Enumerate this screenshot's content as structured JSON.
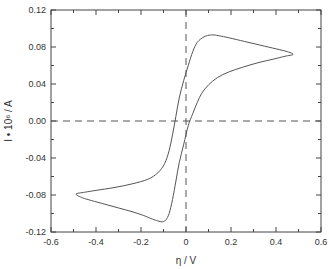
{
  "chart_data": {
    "type": "line",
    "title": "",
    "xlabel": "η / V",
    "ylabel": "I • 10⁶ / A",
    "xlim": [
      -0.6,
      0.6
    ],
    "ylim": [
      -0.12,
      0.12
    ],
    "xticks": [
      -0.6,
      -0.4,
      -0.2,
      0,
      0.2,
      0.4,
      0.6
    ],
    "xtick_labels": [
      "-0.6",
      "-0.4",
      "-0.2",
      "0",
      "0.2",
      "0.4",
      "0.6"
    ],
    "yticks": [
      -0.12,
      -0.08,
      -0.04,
      0.0,
      0.04,
      0.08,
      0.12
    ],
    "ytick_labels": [
      "-0.12",
      "-0.08",
      "-0.04",
      "0.00",
      "0.04",
      "0.08",
      "0.12"
    ],
    "grid": false,
    "reference_lines": [
      {
        "orientation": "horizontal",
        "value": 0,
        "style": "dashed"
      },
      {
        "orientation": "vertical",
        "value": 0,
        "style": "dashed"
      }
    ],
    "series": [
      {
        "name": "cyclic voltammogram",
        "closed": true,
        "x": [
          0.107,
          0.08,
          0.05,
          0.03,
          0.01,
          -0.01,
          -0.03,
          -0.045,
          -0.06,
          -0.075,
          -0.095,
          -0.125,
          -0.17,
          -0.24,
          -0.32,
          -0.4,
          -0.45,
          -0.489,
          -0.46,
          -0.42,
          -0.36,
          -0.3,
          -0.24,
          -0.19,
          -0.15,
          -0.125,
          -0.105,
          -0.09,
          -0.075,
          -0.06,
          -0.045,
          -0.03,
          -0.01,
          0.01,
          0.03,
          0.05,
          0.07,
          0.1,
          0.14,
          0.19,
          0.25,
          0.32,
          0.39,
          0.44,
          0.476,
          0.45,
          0.4,
          0.33,
          0.26,
          0.19,
          0.15,
          0.125
        ],
        "y": [
          0.093,
          0.091,
          0.085,
          0.075,
          0.06,
          0.044,
          0.025,
          0.005,
          -0.015,
          -0.032,
          -0.046,
          -0.056,
          -0.063,
          -0.068,
          -0.072,
          -0.075,
          -0.077,
          -0.079,
          -0.083,
          -0.086,
          -0.09,
          -0.094,
          -0.098,
          -0.102,
          -0.106,
          -0.108,
          -0.109,
          -0.107,
          -0.1,
          -0.085,
          -0.065,
          -0.045,
          -0.025,
          -0.005,
          0.008,
          0.02,
          0.03,
          0.039,
          0.047,
          0.053,
          0.058,
          0.063,
          0.067,
          0.07,
          0.072,
          0.075,
          0.078,
          0.082,
          0.086,
          0.09,
          0.092,
          0.093
        ]
      }
    ]
  }
}
